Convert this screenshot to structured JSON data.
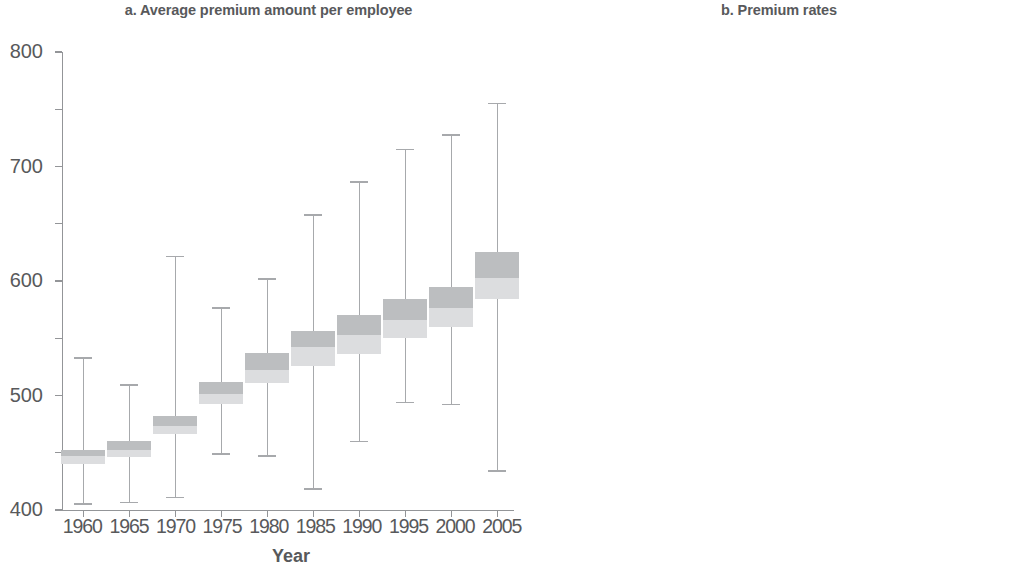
{
  "figure": {
    "background": "#ffffff",
    "text_color": "#58595b",
    "axis_color": "#939598",
    "box_upper_color": "#bcbec0",
    "box_lower_color": "#dcdddf",
    "whisker_color": "#a7a9ac"
  },
  "chart_data": [
    {
      "type": "box",
      "panel": "a",
      "title": "a. Average premium amount per employee",
      "xlabel": "Year",
      "ylabel": "",
      "ylim": [
        0,
        800
      ],
      "yticks": [
        0,
        100,
        200,
        300,
        400,
        500,
        600,
        700,
        800
      ],
      "ytick_labels": [
        "0",
        "100",
        "200",
        "300",
        "400",
        "500",
        "600",
        "700",
        "800"
      ],
      "grid": false,
      "legend": "none",
      "categories": [
        "1960",
        "1965",
        "1970",
        "1975",
        "1980",
        "1985",
        "1990",
        "1995",
        "2000",
        "2005"
      ],
      "boxes": [
        {
          "category": "1960",
          "whisker_low": 10,
          "q1": 80,
          "median": 95,
          "q3": 105,
          "whisker_high": 265
        },
        {
          "category": "1965",
          "whisker_low": 13,
          "q1": 92,
          "median": 104,
          "q3": 120,
          "whisker_high": 218
        },
        {
          "category": "1970",
          "whisker_low": 22,
          "q1": 133,
          "median": 146,
          "q3": 165,
          "whisker_high": 443
        },
        {
          "category": "1975",
          "whisker_low": 98,
          "q1": 185,
          "median": 203,
          "q3": 223,
          "whisker_high": 353
        },
        {
          "category": "1980",
          "whisker_low": 94,
          "q1": 222,
          "median": 245,
          "q3": 275,
          "whisker_high": 404
        },
        {
          "category": "1985",
          "whisker_low": 37,
          "q1": 252,
          "median": 285,
          "q3": 312,
          "whisker_high": 515
        },
        {
          "category": "1990",
          "whisker_low": 120,
          "q1": 272,
          "median": 305,
          "q3": 340,
          "whisker_high": 573
        },
        {
          "category": "1995",
          "whisker_low": 188,
          "q1": 300,
          "median": 332,
          "q3": 368,
          "whisker_high": 630
        },
        {
          "category": "2000",
          "whisker_low": 184,
          "q1": 320,
          "median": 352,
          "q3": 390,
          "whisker_high": 655
        },
        {
          "category": "2005",
          "whisker_low": 68,
          "q1": 368,
          "median": 405,
          "q3": 450,
          "whisker_high": 710
        }
      ]
    },
    {
      "type": "box",
      "panel": "b",
      "title": "b. Premium rates",
      "xlabel": "Year",
      "ylabel": "",
      "ylim": [
        0,
        12
      ],
      "yticks": [
        0,
        2,
        4,
        6,
        8,
        10,
        12
      ],
      "ytick_labels": [
        "0",
        "2",
        "4",
        "6",
        "8",
        "10",
        "12"
      ],
      "grid": false,
      "legend": "none",
      "categories": [
        "1960",
        "1965",
        "1970",
        "1975",
        "1980",
        "1985",
        "1990",
        "1995",
        "2000",
        "2005"
      ],
      "boxes": [
        {
          "category": "1960",
          "whisker_low": 4.5,
          "q1": 6.0,
          "median": 6.25,
          "q3": 6.6,
          "whisker_high": 8.0
        },
        {
          "category": "1965",
          "whisker_low": 4.5,
          "q1": 6.5,
          "median": 6.8,
          "q3": 7.1,
          "whisker_high": 8.05
        },
        {
          "category": "1970",
          "whisker_low": 4.5,
          "q1": 6.5,
          "median": 6.95,
          "q3": 7.2,
          "whisker_high": 8.05
        },
        {
          "category": "1975",
          "whisker_low": 5.35,
          "q1": 7.1,
          "median": 7.35,
          "q3": 7.6,
          "whisker_high": 9.05
        },
        {
          "category": "1980",
          "whisker_low": 5.6,
          "q1": 7.5,
          "median": 7.9,
          "q3": 8.25,
          "whisker_high": 9.05
        },
        {
          "category": "1985",
          "whisker_low": 6.0,
          "q1": 7.75,
          "median": 8.1,
          "q3": 8.45,
          "whisker_high": 9.55
        },
        {
          "category": "1990",
          "whisker_low": 6.0,
          "q1": 7.85,
          "median": 8.25,
          "q3": 8.65,
          "whisker_high": 9.5
        },
        {
          "category": "1995",
          "whisker_low": 6.0,
          "q1": 8.05,
          "median": 8.4,
          "q3": 8.6,
          "whisker_high": 9.5
        },
        {
          "category": "2000",
          "whisker_low": 4.9,
          "q1": 8.35,
          "median": 8.6,
          "q3": 8.95,
          "whisker_high": 9.5
        },
        {
          "category": "2005",
          "whisker_low": 3.1,
          "q1": 6.8,
          "median": 7.45,
          "q3": 8.05,
          "whisker_high": 9.55
        }
      ]
    }
  ]
}
